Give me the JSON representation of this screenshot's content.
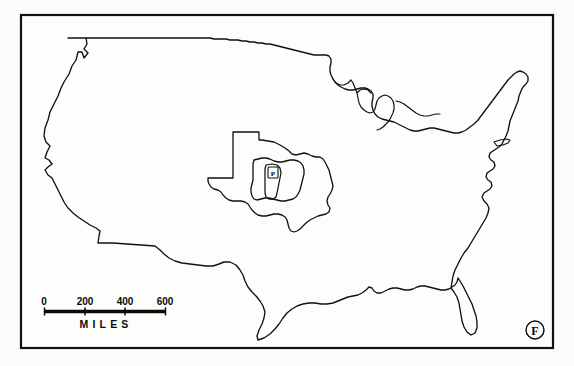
{
  "figure": {
    "label": "F",
    "background_color": "#fbfbfa",
    "line_color": "#111111"
  },
  "frame": {
    "name": "map-border-frame",
    "x": 21,
    "y": 15,
    "width": 532,
    "height": 333
  },
  "scale_bar": {
    "unit_label": "MILES",
    "ticks": [
      "0",
      "200",
      "400",
      "600"
    ],
    "tick_values": [
      0,
      200,
      400,
      600
    ],
    "bar_x_start": 44,
    "bar_x_end": 166,
    "bar_y": 311,
    "max_value": 600
  },
  "overlays": [
    {
      "name": "texas-outline",
      "label": "Texas",
      "role": "outer-comparison-shape"
    },
    {
      "name": "ohio-outline",
      "label": "Ohio",
      "role": "middle-comparison-shape"
    },
    {
      "name": "county-outline",
      "label": "P",
      "role": "inner-comparison-shape"
    }
  ],
  "map": {
    "name": "united-states-outline",
    "region": "Contiguous United States",
    "features": [
      "west-coast",
      "canadian-border",
      "great-lakes",
      "northeast-coast",
      "atlantic-coast",
      "florida-peninsula",
      "gulf-coast",
      "mexican-border"
    ]
  }
}
